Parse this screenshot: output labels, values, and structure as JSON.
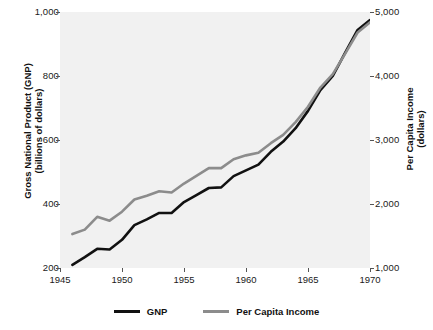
{
  "chart_data": {
    "type": "line",
    "title": "",
    "xlabel": "",
    "ylabel": "Gross National Product (GNP)\n(billions of dollars)",
    "y2label": "Per Capita Income\n(dollars)",
    "grid": false,
    "legend_position": "bottom",
    "xlim": [
      1945,
      1970
    ],
    "ylim": [
      200,
      1000
    ],
    "y2lim": [
      1000,
      5000
    ],
    "xticks": [
      "1945",
      "1950",
      "1955",
      "1960",
      "1965",
      "1970"
    ],
    "yticks_left": [
      "200",
      "400",
      "600",
      "800",
      "1,000"
    ],
    "yticks_right": [
      "1,000",
      "2,000",
      "3,000",
      "4,000",
      "5,000"
    ],
    "x": [
      1946,
      1947,
      1948,
      1949,
      1950,
      1951,
      1952,
      1953,
      1954,
      1955,
      1956,
      1957,
      1958,
      1959,
      1960,
      1961,
      1962,
      1963,
      1964,
      1965,
      1966,
      1967,
      1968,
      1969,
      1970
    ],
    "series": [
      {
        "name": "GNP",
        "axis": "left",
        "color": "#111111",
        "units": "billions of dollars",
        "values": [
          210,
          234,
          260,
          258,
          288,
          334,
          352,
          372,
          372,
          406,
          428,
          450,
          452,
          487,
          505,
          523,
          563,
          595,
          637,
          691,
          756,
          800,
          873,
          944,
          975
        ]
      },
      {
        "name": "Per Capita Income",
        "axis": "right",
        "color": "#8c8c8c",
        "units": "dollars",
        "values": [
          1530,
          1600,
          1800,
          1740,
          1880,
          2070,
          2130,
          2200,
          2180,
          2320,
          2440,
          2560,
          2560,
          2700,
          2760,
          2800,
          2950,
          3080,
          3280,
          3520,
          3820,
          4030,
          4350,
          4680,
          4840
        ]
      }
    ]
  },
  "axes": {
    "left_title_line1": "Gross National Product (GNP)",
    "left_title_line2": "(billions of dollars)",
    "right_title_line1": "Per Capita Income",
    "right_title_line2": "(dollars)"
  },
  "legend": {
    "items": [
      {
        "label": "GNP",
        "color": "#111111"
      },
      {
        "label": "Per Capita Income",
        "color": "#8c8c8c"
      }
    ]
  }
}
